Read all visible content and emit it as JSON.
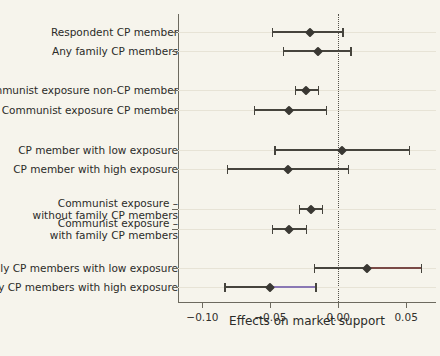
{
  "chart_data": {
    "type": "scatter",
    "subtype": "coefficient-plot-with-confidence-intervals",
    "title": "",
    "xlabel": "Effects on market support",
    "ylabel": "",
    "xlim": [
      -0.118,
      0.072
    ],
    "xticks": [
      -0.1,
      -0.05,
      0.0,
      0.05
    ],
    "xticklabels": [
      "-0.10",
      "-0.05",
      "0.00",
      "0.05"
    ],
    "grid": "faint-horizontal",
    "legend": "none",
    "reference_line": {
      "x": 0.0,
      "style": "dotted",
      "color": "#55524a"
    },
    "point_marker": "diamond",
    "categories": [
      "Respondent CP member",
      "Any family CP members",
      "Communist exposure non-CP member",
      "Communist exposure CP member",
      "CP member with low exposure",
      "CP member with high exposure",
      "Communist exposure –\nwithout family CP members",
      "Communist exposure –\nwith family CP members",
      "Family CP members with low exposure",
      "Family CP members with high exposure"
    ],
    "estimates": [
      {
        "label": "Respondent CP member",
        "value": -0.021,
        "ci_low": -0.049,
        "ci_high": 0.003,
        "tint": null
      },
      {
        "label": "Any family CP members",
        "value": -0.015,
        "ci_low": -0.041,
        "ci_high": 0.009,
        "tint": null
      },
      {
        "label": "Communist exposure non-CP member",
        "value": -0.024,
        "ci_low": -0.032,
        "ci_high": -0.015,
        "tint": null
      },
      {
        "label": "Communist exposure CP member",
        "value": -0.036,
        "ci_low": -0.062,
        "ci_high": -0.009,
        "tint": null
      },
      {
        "label": "CP member with low exposure",
        "value": 0.003,
        "ci_low": -0.047,
        "ci_high": 0.052,
        "tint": null
      },
      {
        "label": "CP member with high exposure",
        "value": -0.037,
        "ci_low": -0.082,
        "ci_high": 0.007,
        "tint": null
      },
      {
        "label": "Communist exposure – without family CP members",
        "value": -0.02,
        "ci_low": -0.029,
        "ci_high": -0.012,
        "tint": null
      },
      {
        "label": "Communist exposure – with family CP members",
        "value": -0.036,
        "ci_low": -0.049,
        "ci_high": -0.024,
        "tint": null
      },
      {
        "label": "Family CP members with low exposure",
        "value": 0.021,
        "ci_low": -0.018,
        "ci_high": 0.061,
        "tint": "#7a4a46"
      },
      {
        "label": "Family CP members with high exposure",
        "value": -0.05,
        "ci_low": -0.084,
        "ci_high": -0.017,
        "tint": "#8a78b4"
      }
    ],
    "group_breaks_after": [
      2,
      4,
      6,
      8
    ]
  },
  "axis": {
    "x_title": "Effects on market support"
  },
  "colors": {
    "background": "#f6f4ec",
    "ink": "#2b2b28",
    "axis": "#6d6a5f",
    "marker": "#3a3833",
    "gridline": "#e7e3d6"
  }
}
